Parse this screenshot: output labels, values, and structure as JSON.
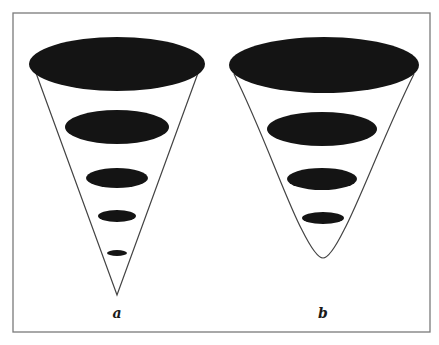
{
  "figure": {
    "frame": {
      "x": 13,
      "y": 13,
      "width": 417,
      "height": 319,
      "stroke": "#7a7a7a"
    },
    "colors": {
      "fill": "#141414",
      "outline": "#444444",
      "background": "#ffffff"
    },
    "panels": [
      {
        "label": "a",
        "shape": "cone-with-straight-sides",
        "label_pos": {
          "x": 117,
          "y": 318
        },
        "ellipses": [
          {
            "cx": 117,
            "cy": 64,
            "rx": 88,
            "ry": 27
          },
          {
            "cx": 117,
            "cy": 127,
            "rx": 52,
            "ry": 17
          },
          {
            "cx": 117,
            "cy": 178,
            "rx": 31,
            "ry": 10
          },
          {
            "cx": 117,
            "cy": 216,
            "rx": 19,
            "ry": 6
          },
          {
            "cx": 117,
            "cy": 253,
            "rx": 10,
            "ry": 3
          }
        ],
        "outline_path": "M 36 73 L 117 295 L 198 73"
      },
      {
        "label": "b",
        "shape": "cone-with-rounded-bottom",
        "label_pos": {
          "x": 323,
          "y": 318
        },
        "ellipses": [
          {
            "cx": 324,
            "cy": 65,
            "rx": 95,
            "ry": 28
          },
          {
            "cx": 322,
            "cy": 129,
            "rx": 55,
            "ry": 17
          },
          {
            "cx": 322,
            "cy": 179,
            "rx": 35,
            "ry": 11
          },
          {
            "cx": 323,
            "cy": 218,
            "rx": 21,
            "ry": 6
          }
        ],
        "outline_path": "M 234 74 C 262 130, 286 200, 302 230 C 312 250, 318 258, 323 258 C 328 258, 334 250, 344 230 C 360 200, 386 130, 414 74"
      }
    ]
  }
}
